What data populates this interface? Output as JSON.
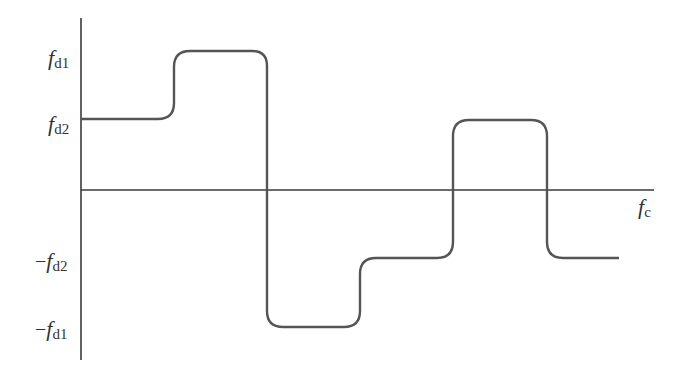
{
  "diagram": {
    "colors": {
      "axis": "#3a3a3a",
      "curve": "#555555",
      "label": "#333333",
      "background": "#ffffff"
    },
    "axes": {
      "x_label": {
        "main": "f",
        "sub": "c"
      },
      "y_ticks": [
        {
          "id": "fd1",
          "sign": "",
          "main": "f",
          "sub": "d1"
        },
        {
          "id": "fd2",
          "sign": "",
          "main": "f",
          "sub": "d2"
        },
        {
          "id": "neg-fd2",
          "sign": "−",
          "main": "f",
          "sub": "d2"
        },
        {
          "id": "neg-fd1",
          "sign": "−",
          "main": "f",
          "sub": "d1"
        }
      ]
    },
    "curve": {
      "description": "Stepped frequency waveform: starts at fd2, rises to fd1, drops to -fd1, rises to -fd2, rises to fd2, drops to -fd2",
      "levels_sequence": [
        "fd2",
        "fd1",
        "-fd1",
        "-fd2",
        "fd2",
        "-fd2"
      ]
    }
  }
}
